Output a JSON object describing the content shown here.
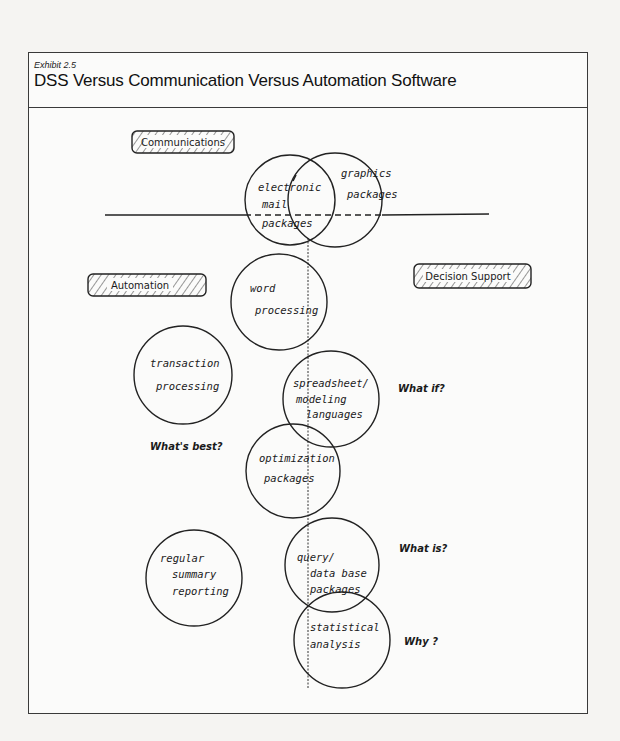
{
  "header": {
    "exhibit": "Exhibit 2.5",
    "title": "DSS Versus Communication Versus Automation Software"
  },
  "categories": [
    {
      "id": "communications",
      "label": "Communications"
    },
    {
      "id": "automation",
      "label": "Automation"
    },
    {
      "id": "decision_support",
      "label": "Decision Support"
    }
  ],
  "circles": [
    {
      "id": "electronic_mail",
      "lines": [
        "electronic",
        "mail",
        "packages"
      ]
    },
    {
      "id": "graphics",
      "lines": [
        "graphics",
        "packages"
      ]
    },
    {
      "id": "word_processing",
      "lines": [
        "word",
        "processing"
      ]
    },
    {
      "id": "transaction_processing",
      "lines": [
        "transaction",
        "processing"
      ]
    },
    {
      "id": "spreadsheet",
      "lines": [
        "spreadsheet/",
        "modeling",
        "languages"
      ]
    },
    {
      "id": "optimization",
      "lines": [
        "optimization",
        "packages"
      ]
    },
    {
      "id": "regular_reporting",
      "lines": [
        "regular",
        "summary",
        "reporting"
      ]
    },
    {
      "id": "query",
      "lines": [
        "query/",
        "data base",
        "packages"
      ]
    },
    {
      "id": "statistical",
      "lines": [
        "statistical",
        "analysis"
      ]
    }
  ],
  "questions": [
    {
      "id": "what_if",
      "label": "What if?"
    },
    {
      "id": "whats_best",
      "label": "What's best?"
    },
    {
      "id": "what_is",
      "label": "What is?"
    },
    {
      "id": "why",
      "label": "Why ?"
    }
  ]
}
